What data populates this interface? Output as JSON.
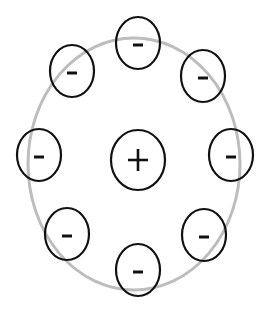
{
  "diagram": {
    "colors": {
      "orbit": "#bdbdbd",
      "outline": "#111111",
      "background": "#ffffff"
    },
    "orbit": {
      "cx": 134,
      "cy": 164,
      "rx": 106,
      "ry": 126
    },
    "nucleus": {
      "label": "+",
      "cx": 138,
      "cy": 160,
      "rx": 27,
      "ry": 30
    },
    "electrons": [
      {
        "id": "top",
        "label": "-",
        "cx": 138,
        "cy": 43
      },
      {
        "id": "upper-right",
        "label": "-",
        "cx": 203,
        "cy": 76
      },
      {
        "id": "right",
        "label": "-",
        "cx": 231,
        "cy": 155
      },
      {
        "id": "lower-right",
        "label": "-",
        "cx": 204,
        "cy": 235
      },
      {
        "id": "bottom",
        "label": "-",
        "cx": 138,
        "cy": 270
      },
      {
        "id": "lower-left",
        "label": "-",
        "cx": 67,
        "cy": 234
      },
      {
        "id": "left",
        "label": "-",
        "cx": 39,
        "cy": 155
      },
      {
        "id": "upper-left",
        "label": "-",
        "cx": 72,
        "cy": 71
      }
    ],
    "electron_size": {
      "rx": 22,
      "ry": 26
    }
  }
}
